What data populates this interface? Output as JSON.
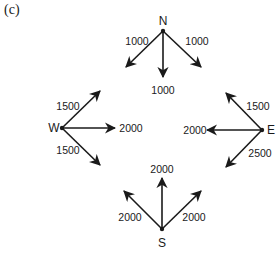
{
  "panel_label": "(c)",
  "nodes": [
    {
      "id": "N",
      "label": "N"
    },
    {
      "id": "W",
      "label": "W"
    },
    {
      "id": "E",
      "label": "E"
    },
    {
      "id": "S",
      "label": "S"
    }
  ],
  "flows": [
    {
      "from": "N",
      "direction": "southwest",
      "value": "1000"
    },
    {
      "from": "N",
      "direction": "south",
      "value": "1000"
    },
    {
      "from": "N",
      "direction": "southeast",
      "value": "1000"
    },
    {
      "from": "W",
      "direction": "northeast",
      "value": "1500"
    },
    {
      "from": "W",
      "direction": "east",
      "value": "2000"
    },
    {
      "from": "W",
      "direction": "southeast",
      "value": "1500"
    },
    {
      "from": "E",
      "direction": "northwest",
      "value": "1500"
    },
    {
      "from": "E",
      "direction": "west",
      "value": "2000"
    },
    {
      "from": "E",
      "direction": "southwest",
      "value": "2500"
    },
    {
      "from": "S",
      "direction": "northwest",
      "value": "2000"
    },
    {
      "from": "S",
      "direction": "north",
      "value": "2000"
    },
    {
      "from": "S",
      "direction": "northeast",
      "value": "2000"
    }
  ]
}
